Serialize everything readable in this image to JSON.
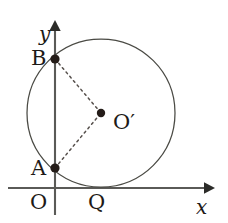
{
  "figure": {
    "kind": "coordinate-geometry-diagram",
    "background_color": "#ffffff",
    "stroke_color": "#4a4a44",
    "axis_color": "#5a5a57",
    "dash_color": "#56504c",
    "dot_color": "#241c18"
  },
  "axes": {
    "x_axis": {
      "label": "x",
      "y": 188,
      "x_start": 8,
      "x_end": 212,
      "arrow": "right"
    },
    "y_axis": {
      "label": "y",
      "x": 55,
      "y_start": 215,
      "y_end": 22,
      "arrow": "up"
    },
    "origin_label": "O"
  },
  "circle": {
    "center_x": 101,
    "center_y": 113,
    "radius": 74,
    "center_label": "O",
    "center_prime": "′"
  },
  "points": [
    {
      "id": "B",
      "label": "B",
      "x": 55,
      "y": 59,
      "label_x": 31,
      "label_y": 47
    },
    {
      "id": "A",
      "label": "A",
      "x": 55,
      "y": 168,
      "label_x": 31,
      "label_y": 159
    },
    {
      "id": "Q",
      "label": "Q",
      "x": 101,
      "y": 187,
      "label_x": 88,
      "label_y": 191
    },
    {
      "id": "O",
      "label": "O",
      "x": 55,
      "y": 188,
      "label_x": 30,
      "label_y": 191
    }
  ],
  "segments": [
    {
      "id": "B-Oprime",
      "from": "B",
      "to": "Oprime",
      "style": "dashed"
    },
    {
      "id": "A-Oprime",
      "from": "A",
      "to": "Oprime",
      "style": "dashed"
    }
  ],
  "labels": {
    "x_axis_label": "x",
    "y_axis_label": "y",
    "point_a": "A",
    "point_b": "B",
    "point_q": "Q",
    "origin": "O",
    "center": "O",
    "center_prime_mark": "′"
  }
}
